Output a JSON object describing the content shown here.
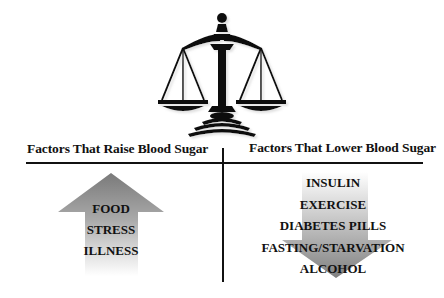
{
  "headings": {
    "raise": "Factors That Raise Blood Sugar",
    "lower": "Factors That Lower Blood Sugar"
  },
  "raise_factors": [
    "FOOD",
    "STRESS",
    "ILLNESS"
  ],
  "lower_factors": [
    "INSULIN",
    "EXERCISE",
    "DIABETES PILLS",
    "FASTING/STARVATION",
    "ALCOHOL"
  ],
  "icons": {
    "scales": "scales-of-justice-icon",
    "up_arrow": "up-arrow-icon",
    "down_arrow": "down-arrow-icon"
  },
  "colors": {
    "ink": "#111111",
    "arrow_gray": "#8a8a8a",
    "background": "#ffffff"
  }
}
